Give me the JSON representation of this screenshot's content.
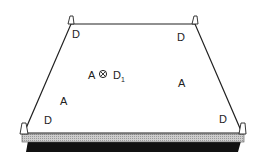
{
  "diagram": {
    "labels": {
      "top_left": "D",
      "top_right": "D",
      "center_a": "A",
      "center_d": "D",
      "center_d_sub": "1",
      "left_a": "A",
      "right_a": "A",
      "bottom_left": "D",
      "bottom_right": "D"
    },
    "symbols": {
      "center_marker": "circled-cross-marker"
    },
    "colors": {
      "line": "#222222",
      "base_gray": "#bdbdbd",
      "base_black": "#111111"
    }
  }
}
